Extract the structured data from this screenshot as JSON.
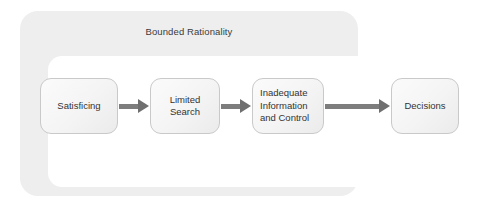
{
  "diagram": {
    "container": {
      "title": "Bounded Rationality"
    },
    "nodes": [
      {
        "id": "satisficing",
        "label": "Satisficing"
      },
      {
        "id": "limited-search",
        "label": "Limited\nSearch"
      },
      {
        "id": "inadequate-info",
        "label": "Inadequate\nInformation\nand Control"
      },
      {
        "id": "decisions",
        "label": "Decisions"
      }
    ],
    "arrows": [
      {
        "id": "arrow-1",
        "from": "satisficing",
        "to": "limited-search",
        "icon": "arrow-right-icon"
      },
      {
        "id": "arrow-2",
        "from": "limited-search",
        "to": "inadequate-info",
        "icon": "arrow-right-icon"
      },
      {
        "id": "arrow-3",
        "from": "inadequate-info",
        "to": "decisions",
        "icon": "arrow-right-icon"
      }
    ],
    "colors": {
      "page_background": "#ffffff",
      "outer_container_fill": "#eeeeee",
      "inner_well_fill": "#ffffff",
      "node_border": "#c9c9c9",
      "node_fill": "#f4f4f4",
      "arrow": "#7d7d7d",
      "text": "#333333",
      "title_text": "#3b3b3b"
    }
  }
}
